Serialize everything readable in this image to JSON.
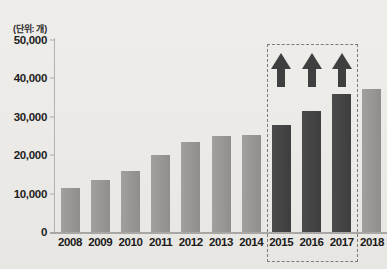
{
  "chart_data": {
    "type": "bar",
    "title": "",
    "unit_caption": "(단위: 개)",
    "xlabel": "",
    "ylabel": "",
    "categories": [
      "2008",
      "2009",
      "2010",
      "2011",
      "2012",
      "2013",
      "2014",
      "2015",
      "2016",
      "2017",
      "2018"
    ],
    "values": [
      11500,
      13500,
      16000,
      20000,
      23500,
      25000,
      25200,
      27800,
      31500,
      36000,
      37200
    ],
    "series": [
      {
        "name": "개수",
        "values": [
          11500,
          13500,
          16000,
          20000,
          23500,
          25000,
          25200,
          27800,
          31500,
          36000,
          37200
        ]
      }
    ],
    "bar_colors": [
      "#9a9895",
      "#9a9895",
      "#9a9895",
      "#9a9895",
      "#9a9895",
      "#9a9895",
      "#9a9895",
      "#454545",
      "#454545",
      "#454545",
      "#9a9895"
    ],
    "ylim": [
      0,
      50000
    ],
    "ytick_values": [
      0,
      10000,
      20000,
      30000,
      40000,
      50000
    ],
    "ytick_labels": [
      "0",
      "10,000",
      "20,000",
      "30,000",
      "40,000",
      "50,000"
    ],
    "grid": false,
    "legend": "none",
    "annotations": {
      "highlight_box": {
        "categories": [
          "2015",
          "2016",
          "2017"
        ],
        "style": "dashed",
        "color": "#7d7b78"
      },
      "arrows": [
        {
          "category": "2015",
          "direction": "up",
          "color": "#3f3f3f"
        },
        {
          "category": "2016",
          "direction": "up",
          "color": "#3f3f3f"
        },
        {
          "category": "2017",
          "direction": "up",
          "color": "#3f3f3f"
        }
      ]
    },
    "colors": {
      "background": "#eceae7",
      "bar_gray": "#9a9895",
      "bar_dark": "#454545",
      "axis": "#a9a7a3",
      "text": "#1d1d1d"
    }
  }
}
